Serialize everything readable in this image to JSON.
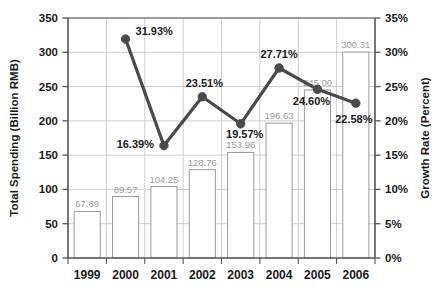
{
  "chart_data": {
    "type": "bar",
    "title": "",
    "categories": [
      "1999",
      "2000",
      "2001",
      "2002",
      "2003",
      "2004",
      "2005",
      "2006"
    ],
    "xlabel": "",
    "ylabel": "Total Spending (Billion RMB)",
    "y2label": "Growth Rate (Percent)",
    "ylim": [
      0,
      350
    ],
    "y2lim": [
      0,
      35
    ],
    "yticks": [
      "0",
      "50",
      "100",
      "150",
      "200",
      "250",
      "300",
      "350"
    ],
    "ytick_values": [
      0,
      50,
      100,
      150,
      200,
      250,
      300,
      350
    ],
    "y2ticks": [
      "0%",
      "5%",
      "10%",
      "15%",
      "20%",
      "25%",
      "30%",
      "35%"
    ],
    "y2tick_values": [
      0,
      5,
      10,
      15,
      20,
      25,
      30,
      35
    ],
    "grid": true,
    "legend": "none",
    "series": [
      {
        "name": "Total Spending (Billion RMB)",
        "type": "bar",
        "axis": "left",
        "color": "#ffffff",
        "edge_color": "#9a9a9a",
        "values": [
          67.89,
          89.57,
          104.25,
          128.76,
          153.96,
          196.63,
          245.0,
          300.31
        ],
        "labels": [
          "67.89",
          "89.57",
          "104.25",
          "128.76",
          "153.96",
          "196.63",
          "245.00",
          "300.31"
        ]
      },
      {
        "name": "Growth Rate (Percent)",
        "type": "line",
        "axis": "right",
        "color": "#4a4a4a",
        "x": [
          "2000",
          "2001",
          "2002",
          "2003",
          "2004",
          "2005",
          "2006"
        ],
        "values": [
          31.93,
          16.39,
          23.51,
          19.57,
          27.71,
          24.6,
          22.58
        ],
        "labels": [
          "31.93%",
          "16.39%",
          "23.51%",
          "19.57%",
          "27.71%",
          "24.60%",
          "22.58%"
        ]
      }
    ]
  },
  "colors": {
    "line": "#4a4a4a",
    "bar_edge": "#9a9a9a",
    "grid": "#c8c8c8",
    "axis": "#555555",
    "text": "#1a1a1a",
    "bar_label_text": "#9a9a9a"
  }
}
